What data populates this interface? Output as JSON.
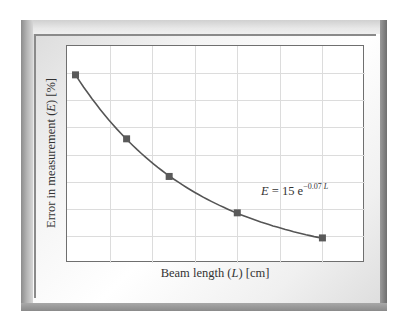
{
  "chart_data": {
    "type": "line",
    "title": "",
    "xlabel": "Beam length (L) [cm]",
    "ylabel": "Error in measurement (E) [%]",
    "annotation": "E = 15 e^(-0.07 L)",
    "grid": true,
    "legend": null,
    "x_ticks_labeled": false,
    "y_ticks_labeled": false,
    "series": [
      {
        "name": "Measured error",
        "marker": "square",
        "x": [
          0,
          6,
          11,
          19,
          29
        ],
        "values": [
          15.0,
          9.9,
          6.9,
          4.0,
          2.0
        ]
      },
      {
        "name": "Fit E = 15 e^(-0.07 L)",
        "marker": "none",
        "function": "15*exp(-0.07*L)",
        "x_range": [
          0,
          29
        ]
      }
    ],
    "xlim": [
      -1,
      34
    ],
    "ylim": [
      0,
      17.3
    ]
  },
  "labels": {
    "x_axis_prefix": "Beam length (",
    "x_axis_var": "L",
    "x_axis_suffix": ") [cm]",
    "y_axis_prefix": "Error in measurement (",
    "y_axis_var": "E",
    "y_axis_suffix": ") [%]",
    "eq_lhs": "E",
    "eq_mid": " = 15 e",
    "eq_exp": "−0.07 ",
    "eq_exp_var": "L"
  },
  "colors": {
    "curve": "#555555",
    "marker": "#5a5a5a",
    "grid": "#dcdcdc",
    "axis": "#6f6f6f"
  }
}
